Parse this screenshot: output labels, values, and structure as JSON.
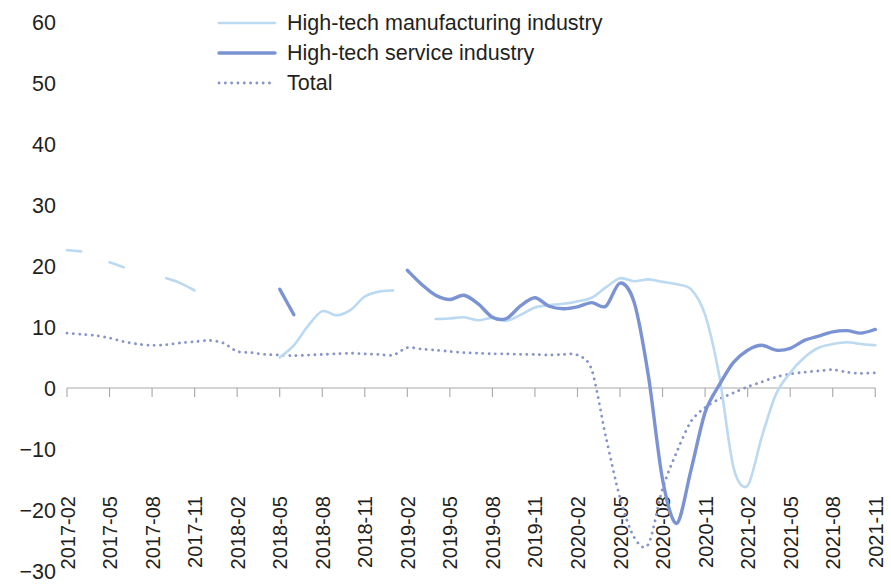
{
  "chart_data": {
    "type": "line",
    "title": "",
    "subtitle": "",
    "xlabel": "",
    "ylabel": "",
    "ylim": [
      -30,
      60
    ],
    "yticks": [
      -30,
      -20,
      -10,
      0,
      10,
      20,
      30,
      40,
      50,
      60
    ],
    "ytick_labels": [
      "−30",
      "−20",
      "−10",
      "0",
      "10",
      "20",
      "30",
      "40",
      "50",
      "60"
    ],
    "grid": false,
    "legend_position": "top-center",
    "xtick_labels": [
      "2017-02",
      "2017-05",
      "2017-08",
      "2017-11",
      "2018-02",
      "2018-05",
      "2018-08",
      "2018-11",
      "2019-02",
      "2019-05",
      "2019-08",
      "2019-11",
      "2020-02",
      "2020-05",
      "2020-08",
      "2020-11",
      "2021-02",
      "2021-05",
      "2021-08",
      "2021-11"
    ],
    "x": [
      "2017-02",
      "2017-03",
      "2017-04",
      "2017-05",
      "2017-06",
      "2017-07",
      "2017-08",
      "2017-09",
      "2017-10",
      "2017-11",
      "2017-12",
      "2018-01",
      "2018-02",
      "2018-03",
      "2018-04",
      "2018-05",
      "2018-06",
      "2018-07",
      "2018-08",
      "2018-09",
      "2018-10",
      "2018-11",
      "2018-12",
      "2019-01",
      "2019-02",
      "2019-03",
      "2019-04",
      "2019-05",
      "2019-06",
      "2019-07",
      "2019-08",
      "2019-09",
      "2019-10",
      "2019-11",
      "2019-12",
      "2020-01",
      "2020-02",
      "2020-03",
      "2020-04",
      "2020-05",
      "2020-06",
      "2020-07",
      "2020-08",
      "2020-09",
      "2020-10",
      "2020-11",
      "2020-12",
      "2021-01",
      "2021-02",
      "2021-03",
      "2021-04",
      "2021-05",
      "2021-06",
      "2021-07",
      "2021-08",
      "2021-09",
      "2021-10",
      "2021-11"
    ],
    "series": [
      {
        "name": "High-tech manufacturing industry",
        "color": "#bcd9f2",
        "style": "solid",
        "width": 2.6,
        "values": [
          22.6,
          22.4,
          null,
          20.6,
          19.8,
          null,
          null,
          18.0,
          17.2,
          16.0,
          null,
          null,
          null,
          null,
          null,
          5.0,
          7.0,
          10.2,
          12.6,
          11.9,
          12.8,
          15.0,
          15.8,
          16.0,
          null,
          null,
          11.3,
          11.4,
          11.6,
          11.1,
          11.5,
          11.0,
          12.0,
          13.2,
          13.6,
          13.8,
          14.2,
          14.8,
          16.5,
          18.0,
          17.5,
          17.8,
          17.4,
          17.0,
          16.2,
          12.0,
          2.0,
          -13.0,
          -16.0,
          -8.0,
          -1.0,
          2.5,
          5.0,
          6.6,
          7.2,
          7.5,
          7.2,
          7.0
        ]
      },
      {
        "name": "High-tech service industry",
        "color": "#7b93d3",
        "style": "solid",
        "width": 3.4,
        "values": [
          null,
          null,
          null,
          null,
          null,
          null,
          null,
          null,
          null,
          null,
          null,
          null,
          null,
          null,
          null,
          16.2,
          12.0,
          null,
          null,
          null,
          null,
          null,
          null,
          null,
          19.3,
          17.0,
          15.2,
          14.5,
          15.2,
          13.8,
          11.6,
          11.4,
          13.5,
          14.8,
          13.4,
          13.0,
          13.3,
          14.0,
          13.4,
          17.2,
          14.0,
          2.0,
          -15.0,
          -22.2,
          -13.5,
          -4.0,
          0.5,
          4.2,
          6.2,
          7.0,
          6.2,
          6.5,
          7.8,
          8.5,
          9.2,
          9.4,
          9.0,
          9.6
        ]
      },
      {
        "name": "Total",
        "color": "#8794c9",
        "style": "dotted",
        "width": 2.8,
        "values": [
          9.0,
          8.8,
          8.6,
          8.2,
          7.6,
          7.2,
          7.0,
          7.1,
          7.4,
          7.6,
          7.8,
          7.4,
          6.0,
          5.8,
          5.5,
          5.4,
          5.3,
          5.4,
          5.5,
          5.6,
          5.7,
          5.6,
          5.5,
          5.4,
          6.6,
          6.4,
          6.2,
          6.0,
          5.8,
          5.7,
          5.6,
          5.6,
          5.5,
          5.5,
          5.4,
          5.5,
          5.4,
          3.0,
          -8.0,
          -18.0,
          -24.5,
          -25.6,
          -16.5,
          -10.5,
          -5.5,
          -3.2,
          -1.8,
          -0.8,
          0.2,
          1.0,
          1.8,
          2.3,
          2.6,
          2.8,
          3.0,
          2.6,
          2.4,
          2.5
        ]
      }
    ],
    "series_late": [
      {
        "name": "High-tech manufacturing industry",
        "segment": "2021",
        "note": "post-peak decline"
      }
    ]
  },
  "legend": {
    "items": [
      {
        "label": "High-tech manufacturing industry",
        "swatch": "line-light-solid"
      },
      {
        "label": "High-tech service industry",
        "swatch": "line-blue-solid"
      },
      {
        "label": "Total",
        "swatch": "line-dotted"
      }
    ]
  },
  "axes": {
    "y_tick_labels": [
      "60",
      "50",
      "40",
      "30",
      "20",
      "10",
      "0",
      "−10",
      "−20",
      "−30"
    ],
    "x_tick_labels": [
      "2017-02",
      "2017-05",
      "2017-08",
      "2017-11",
      "2018-02",
      "2018-05",
      "2018-08",
      "2018-11",
      "2019-02",
      "2019-05",
      "2019-08",
      "2019-11",
      "2020-02",
      "2020-05",
      "2020-08",
      "2020-11",
      "2021-02",
      "2021-05",
      "2021-08",
      "2021-11"
    ]
  },
  "colors": {
    "manufacturing": "#bcd9f2",
    "service": "#7b93d3",
    "total": "#8794c9",
    "axis": "#a8a8a8",
    "text": "#231f20",
    "background": "#ffffff"
  }
}
